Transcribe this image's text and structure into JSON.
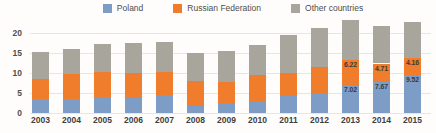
{
  "chart_data": {
    "type": "bar",
    "stacked": true,
    "title": "",
    "xlabel": "",
    "ylabel": "",
    "categories": [
      "2003",
      "2004",
      "2005",
      "2006",
      "2007",
      "2008",
      "2009",
      "2010",
      "2011",
      "2012",
      "2013",
      "2014",
      "2015"
    ],
    "series": [
      {
        "name": "Poland",
        "color": "#7d9cc6",
        "values": [
          3.5,
          3.6,
          4.0,
          3.8,
          4.4,
          1.8,
          2.4,
          3.0,
          4.3,
          4.9,
          7.02,
          7.67,
          9.52
        ],
        "labels": [
          null,
          null,
          null,
          null,
          null,
          null,
          null,
          null,
          null,
          null,
          "7.02",
          "7.67",
          "9.52"
        ]
      },
      {
        "name": "Russian Federation",
        "color": "#ef7d2b",
        "values": [
          5.0,
          6.2,
          6.3,
          6.3,
          5.8,
          6.3,
          5.3,
          6.5,
          5.6,
          6.5,
          6.22,
          4.71,
          4.16
        ],
        "labels": [
          null,
          null,
          null,
          null,
          null,
          null,
          null,
          null,
          null,
          null,
          "6.22",
          "4.71",
          "4.16"
        ]
      },
      {
        "name": "Other countries",
        "color": "#a7a59c",
        "values": [
          6.7,
          6.1,
          6.9,
          7.3,
          7.6,
          6.9,
          7.8,
          7.5,
          9.6,
          9.8,
          10.1,
          9.4,
          9.1
        ],
        "labels": [
          null,
          null,
          null,
          null,
          null,
          null,
          null,
          null,
          null,
          null,
          null,
          null,
          null
        ]
      }
    ],
    "yticks": [
      0,
      5,
      10,
      15,
      20
    ],
    "ylim": [
      0,
      20
    ],
    "grid": true,
    "legend_position": "top",
    "colors": {
      "grid": "#e8e6e2",
      "axis_text": "#4f4f4f",
      "category_text": "#3f3f3f",
      "data_label_text": "#3a3a3a",
      "background": "#fefdfb"
    }
  }
}
